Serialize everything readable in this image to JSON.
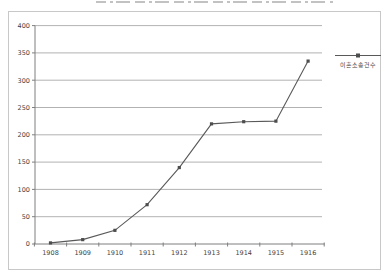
{
  "chart_data": {
    "type": "line",
    "title": "",
    "categories": [
      "1908",
      "1909",
      "1910",
      "1911",
      "1912",
      "1913",
      "1914",
      "1915",
      "1916"
    ],
    "series": [
      {
        "name": "이혼소송건수",
        "values": [
          2,
          8,
          25,
          72,
          140,
          220,
          224,
          225,
          335
        ]
      }
    ],
    "xlabel": "",
    "ylabel": "",
    "ylim": [
      0,
      400
    ],
    "yticks": [
      0,
      50,
      100,
      150,
      200,
      250,
      300,
      350,
      400
    ],
    "grid": true,
    "legend_position": "right",
    "marker": "square",
    "colors": {
      "line": "#595959",
      "marker": "#4d4d4d",
      "grid": "#9e9e9e",
      "axis": "#7f7f7f",
      "tick_text": "#3f3f3f",
      "frame": "#c8c8c8",
      "top_artifact": "#c2c2c2",
      "background": "#ffffff"
    }
  }
}
